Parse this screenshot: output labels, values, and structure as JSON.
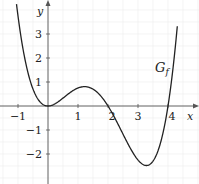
{
  "chart_data": {
    "type": "line",
    "title": "",
    "xlabel": "x",
    "ylabel": "y",
    "function_label": "G",
    "function_label_sub": "f",
    "xlim": [
      -1.6,
      5.0
    ],
    "ylim": [
      -3.3,
      4.4
    ],
    "grid": true,
    "x_ticks": [
      -1,
      1,
      2,
      3,
      4
    ],
    "x_tick_labels": [
      "−1",
      "1",
      "2",
      "3",
      "4"
    ],
    "y_ticks": [
      -2,
      -1,
      1,
      2,
      3
    ],
    "y_tick_labels": [
      "−2",
      "−1",
      "1",
      "2",
      "3"
    ],
    "series": [
      {
        "name": "G_f",
        "formula": "f(x) = 0.25·x²·(x−2)·(x−4)",
        "points": [
          {
            "x": -1.0,
            "y": 3.75
          },
          {
            "x": -0.5,
            "y": 0.7
          },
          {
            "x": 0.0,
            "y": 0.0
          },
          {
            "x": 0.5,
            "y": 0.22
          },
          {
            "x": 1.0,
            "y": 0.75
          },
          {
            "x": 1.25,
            "y": 0.81
          },
          {
            "x": 1.5,
            "y": 0.7
          },
          {
            "x": 2.0,
            "y": 0.0
          },
          {
            "x": 2.5,
            "y": -1.17
          },
          {
            "x": 3.0,
            "y": -2.25
          },
          {
            "x": 3.25,
            "y": -2.48
          },
          {
            "x": 3.5,
            "y": -2.3
          },
          {
            "x": 4.0,
            "y": 0.0
          },
          {
            "x": 4.2,
            "y": 1.94
          }
        ]
      }
    ],
    "line_color": "#222222"
  }
}
